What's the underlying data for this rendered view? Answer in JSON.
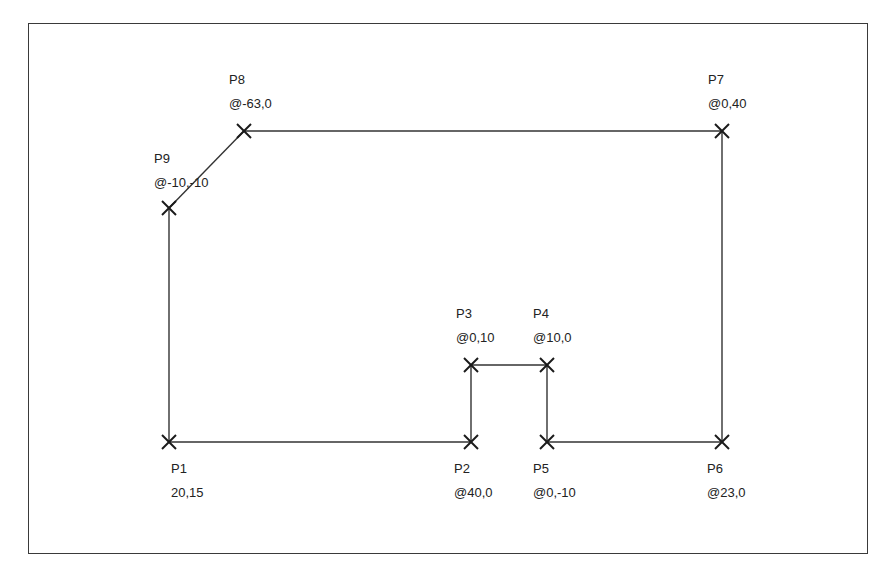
{
  "diagram": {
    "type": "polyline-coordinate-entry",
    "line_color": "#333333",
    "marker_color": "#1a1a1a",
    "points": [
      {
        "id": "P1",
        "name": "P1",
        "coord": "20,15",
        "x": 169,
        "y": 442,
        "label_pos": "below"
      },
      {
        "id": "P2",
        "name": "P2",
        "coord": "@40,0",
        "x": 471,
        "y": 442,
        "label_pos": "below"
      },
      {
        "id": "P3",
        "name": "P3",
        "coord": "@0,10",
        "x": 471,
        "y": 365,
        "label_pos": "above"
      },
      {
        "id": "P4",
        "name": "P4",
        "coord": "@10,0",
        "x": 547,
        "y": 365,
        "label_pos": "above"
      },
      {
        "id": "P5",
        "name": "P5",
        "coord": "@0,-10",
        "x": 547,
        "y": 442,
        "label_pos": "below"
      },
      {
        "id": "P6",
        "name": "P6",
        "coord": "@23,0",
        "x": 722,
        "y": 442,
        "label_pos": "below"
      },
      {
        "id": "P7",
        "name": "P7",
        "coord": "@0,40",
        "x": 722,
        "y": 131,
        "label_pos": "above"
      },
      {
        "id": "P8",
        "name": "P8",
        "coord": "@-63,0",
        "x": 244,
        "y": 131,
        "label_pos": "above"
      },
      {
        "id": "P9",
        "name": "P9",
        "coord": "@-10,-10",
        "x": 169,
        "y": 208,
        "label_pos": "above"
      }
    ],
    "segments": [
      [
        "P1",
        "P2"
      ],
      [
        "P2",
        "P3"
      ],
      [
        "P3",
        "P4"
      ],
      [
        "P4",
        "P5"
      ],
      [
        "P5",
        "P6"
      ],
      [
        "P6",
        "P7"
      ],
      [
        "P7",
        "P8"
      ],
      [
        "P8",
        "P9"
      ],
      [
        "P9",
        "P1"
      ]
    ]
  },
  "labels": {
    "p1": {
      "name": "P1",
      "coord": "20,15"
    },
    "p2": {
      "name": "P2",
      "coord": "@40,0"
    },
    "p3": {
      "name": "P3",
      "coord": "@0,10"
    },
    "p4": {
      "name": "P4",
      "coord": "@10,0"
    },
    "p5": {
      "name": "P5",
      "coord": "@0,-10"
    },
    "p6": {
      "name": "P6",
      "coord": "@23,0"
    },
    "p7": {
      "name": "P7",
      "coord": "@0,40"
    },
    "p8": {
      "name": "P8",
      "coord": "@-63,0"
    },
    "p9": {
      "name": "P9",
      "coord": "@-10,-10"
    }
  }
}
